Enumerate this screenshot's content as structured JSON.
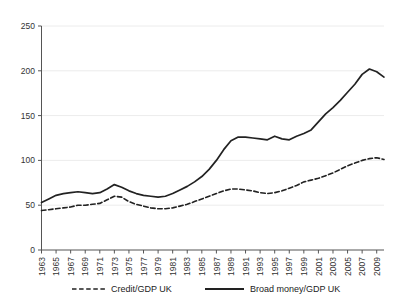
{
  "chart_data": {
    "type": "line",
    "title": "",
    "subtitle": "",
    "xlabel": "",
    "ylabel": "",
    "xlim": [
      1963,
      2010
    ],
    "ylim": [
      0,
      250
    ],
    "grid": true,
    "legend_position": "bottom",
    "y_ticks": [
      0,
      50,
      100,
      150,
      200,
      250
    ],
    "x_ticks": [
      1963,
      1965,
      1967,
      1969,
      1971,
      1973,
      1975,
      1977,
      1979,
      1981,
      1983,
      1985,
      1987,
      1989,
      1991,
      1993,
      1995,
      1997,
      1999,
      2001,
      2003,
      2005,
      2007,
      2009
    ],
    "x": [
      1963,
      1964,
      1965,
      1966,
      1967,
      1968,
      1969,
      1970,
      1971,
      1972,
      1973,
      1974,
      1975,
      1976,
      1977,
      1978,
      1979,
      1980,
      1981,
      1982,
      1983,
      1984,
      1985,
      1986,
      1987,
      1988,
      1989,
      1990,
      1991,
      1992,
      1993,
      1994,
      1995,
      1996,
      1997,
      1998,
      1999,
      2000,
      2001,
      2002,
      2003,
      2004,
      2005,
      2006,
      2007,
      2008,
      2009,
      2010
    ],
    "series": [
      {
        "name": "Credit/GDP UK",
        "style": "dashed",
        "color": "#222222",
        "values": [
          44,
          45,
          46,
          47,
          48,
          50,
          50,
          51,
          52,
          56,
          60,
          59,
          54,
          51,
          49,
          47,
          46,
          46,
          47,
          49,
          51,
          54,
          57,
          60,
          63,
          66,
          68,
          68,
          67,
          66,
          64,
          63,
          64,
          66,
          69,
          72,
          76,
          78,
          80,
          83,
          86,
          90,
          94,
          97,
          100,
          102,
          103,
          101
        ]
      },
      {
        "name": "Broad money/GDP UK",
        "style": "solid",
        "color": "#222222",
        "values": [
          53,
          57,
          61,
          63,
          64,
          65,
          64,
          63,
          64,
          68,
          73,
          70,
          66,
          63,
          61,
          60,
          59,
          60,
          63,
          67,
          71,
          76,
          82,
          90,
          100,
          112,
          122,
          126,
          126,
          125,
          124,
          123,
          127,
          124,
          123,
          127,
          130,
          134,
          143,
          152,
          159,
          167,
          176,
          185,
          196,
          202,
          199,
          193
        ]
      }
    ]
  },
  "legend": {
    "items": [
      {
        "label": "Credit/GDP UK",
        "style": "dashed"
      },
      {
        "label": "Broad money/GDP UK",
        "style": "solid"
      }
    ]
  }
}
